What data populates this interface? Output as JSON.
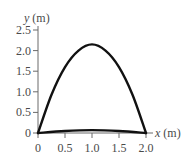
{
  "chart_data": {
    "type": "line",
    "title": "",
    "xlabel": "x (m)",
    "ylabel": "y (m)",
    "xlabel_var": "x",
    "xlabel_unit": "(m)",
    "ylabel_var": "y",
    "ylabel_unit": "(m)",
    "xlim": [
      0,
      2.0
    ],
    "ylim": [
      0,
      2.5
    ],
    "grid": false,
    "legend": "none",
    "x_ticks": [
      "0",
      "0.5",
      "1.0",
      "1.5",
      "2.0"
    ],
    "y_ticks": [
      "0",
      "0.5",
      "1.0",
      "1.5",
      "2.0",
      "2.5"
    ],
    "series": [
      {
        "name": "high trajectory",
        "x": [
          0,
          0.25,
          0.5,
          0.75,
          1.0,
          1.25,
          1.5,
          1.75,
          2.0
        ],
        "y": [
          0,
          0.93,
          1.6,
          2.0,
          2.15,
          2.0,
          1.6,
          0.93,
          0
        ]
      },
      {
        "name": "low trajectory",
        "x": [
          0,
          0.5,
          1.0,
          1.5,
          2.0
        ],
        "y": [
          0,
          0.05,
          0.07,
          0.05,
          0
        ]
      }
    ],
    "colors": {
      "curve": "#111111",
      "axis": "#6a6a6a",
      "text": "#4a4a4a"
    }
  }
}
